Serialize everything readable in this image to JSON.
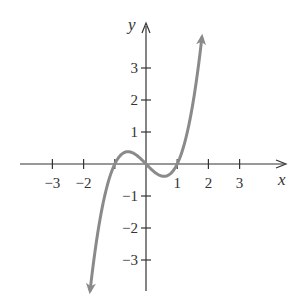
{
  "chart_data": {
    "type": "line",
    "title": "",
    "xlabel": "x",
    "ylabel": "y",
    "function": "y = x^3 - x",
    "x_ticks": [
      -3,
      -2,
      1,
      2,
      3
    ],
    "x_tick_labels": [
      "−3",
      "−2",
      "1",
      "2",
      "3"
    ],
    "x_tick_positions_unlabeled": [
      -1
    ],
    "y_ticks": [
      3,
      2,
      1,
      -1,
      -2,
      -3
    ],
    "y_tick_labels": [
      "3",
      "2",
      "1",
      "−1",
      "−2",
      "−3"
    ],
    "xlim": [
      -3.9,
      4.5
    ],
    "ylim": [
      -4.2,
      4.4
    ],
    "grid": false,
    "legend": null,
    "series": [
      {
        "name": "curve",
        "color": "#8a8a8a",
        "domain": [
          -1.79,
          1.79
        ],
        "arrows_both_ends": true,
        "x": [
          -1.79,
          -1.5,
          -1.25,
          -1.0,
          -0.75,
          -0.577,
          -0.5,
          -0.25,
          0.0,
          0.25,
          0.5,
          0.577,
          0.75,
          1.0,
          1.25,
          1.5,
          1.79
        ],
        "y": [
          -3.95,
          -1.875,
          -0.703,
          0.0,
          0.328,
          0.385,
          0.375,
          0.234,
          0.0,
          -0.234,
          -0.375,
          -0.385,
          -0.328,
          0.0,
          0.703,
          1.875,
          3.95
        ]
      }
    ],
    "key_points": {
      "roots": [
        -1,
        0,
        1
      ],
      "local_max": [
        -0.577,
        0.385
      ],
      "local_min": [
        0.577,
        -0.385
      ]
    }
  },
  "labels": {
    "x_axis": "x",
    "y_axis": "y"
  }
}
